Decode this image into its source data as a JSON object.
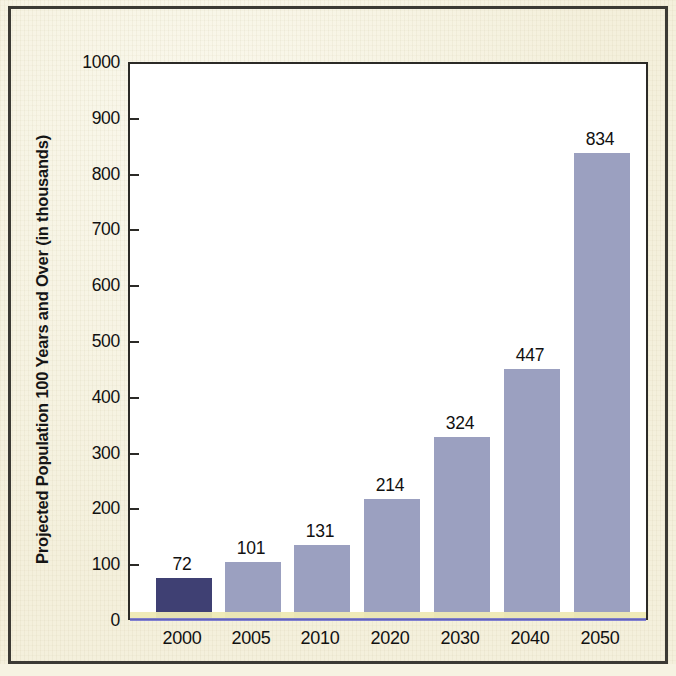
{
  "figure": {
    "background_color": "#f4f0dc",
    "plot_background_color": "#ffffff",
    "frame_color": "#3b3a34"
  },
  "chart_data": {
    "type": "bar",
    "title": "",
    "subtitle": "",
    "xlabel": "",
    "ylabel": "Projected Population 100 Years and Over (in thousands)",
    "categories": [
      "2000",
      "2005",
      "2010",
      "2020",
      "2030",
      "2040",
      "2050"
    ],
    "values": [
      72,
      101,
      131,
      214,
      324,
      447,
      834
    ],
    "value_labels": [
      "72",
      "101",
      "131",
      "214",
      "324",
      "447",
      "834"
    ],
    "ylim": [
      0,
      1000
    ],
    "y_ticks": [
      0,
      100,
      200,
      300,
      400,
      500,
      600,
      700,
      800,
      900,
      1000
    ],
    "y_tick_labels": [
      "0",
      "100",
      "200",
      "300",
      "400",
      "500",
      "600",
      "700",
      "800",
      "900",
      "1000"
    ],
    "grid": false,
    "legend": null,
    "bar_colors": [
      "#3f4073",
      "#9ba0c0",
      "#9ba0c0",
      "#9ba0c0",
      "#9ba0c0",
      "#9ba0c0",
      "#9ba0c0"
    ],
    "highlight_color": "#3f4073",
    "series_color": "#9ba0c0",
    "annotations": []
  }
}
